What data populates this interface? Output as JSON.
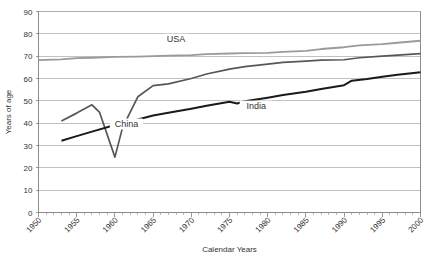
{
  "chart_data": {
    "type": "line",
    "title": "",
    "xlabel": "Calendar Years",
    "ylabel": "Years of age",
    "xlim": [
      1950,
      2000
    ],
    "ylim": [
      0,
      90
    ],
    "ytick_step": 10,
    "xtick_step": 5,
    "grid": true,
    "legend_position": "inline-annotations",
    "ytick_labels": [
      "0",
      "10",
      "20",
      "30",
      "40",
      "50",
      "60",
      "70",
      "80",
      "90"
    ],
    "ytick_values": [
      0,
      10,
      20,
      30,
      40,
      50,
      60,
      70,
      80,
      90
    ],
    "xtick_labels": [
      "1950",
      "1955",
      "1960",
      "1965",
      "1970",
      "1975",
      "1980",
      "1985",
      "1990",
      "1995",
      "2000"
    ],
    "xtick_values": [
      1950,
      1955,
      1960,
      1965,
      1970,
      1975,
      1980,
      1985,
      1990,
      1995,
      2000
    ],
    "series": [
      {
        "name": "USA",
        "color": "#9a9a9a",
        "width": 1.8,
        "label": "USA",
        "label_x": 1968.0,
        "label_y": 76.5,
        "x": [
          1950,
          1953,
          1955,
          1957,
          1960,
          1963,
          1965,
          1967,
          1970,
          1972,
          1975,
          1977,
          1980,
          1982,
          1985,
          1987,
          1990,
          1992,
          1995,
          1997,
          2000
        ],
        "values": [
          68.2,
          68.6,
          69.1,
          69.3,
          69.7,
          69.8,
          70.0,
          70.2,
          70.5,
          70.9,
          71.2,
          71.4,
          71.5,
          71.9,
          72.4,
          73.2,
          74.0,
          74.8,
          75.4,
          76.0,
          76.9
        ]
      },
      {
        "name": "China",
        "color": "#575757",
        "width": 1.7,
        "label": "China",
        "label_x": 1961.5,
        "label_y": 38.5,
        "x": [
          1953,
          1955,
          1957,
          1958,
          1960,
          1961,
          1963,
          1965,
          1967,
          1970,
          1972,
          1975,
          1977,
          1980,
          1982,
          1985,
          1987,
          1990,
          1992,
          1995,
          1997,
          2000
        ],
        "values": [
          41.0,
          44.5,
          48.2,
          44.8,
          24.8,
          38.0,
          51.8,
          56.8,
          57.6,
          60.0,
          62.0,
          64.2,
          65.3,
          66.4,
          67.2,
          67.8,
          68.2,
          68.4,
          69.3,
          70.0,
          70.5,
          71.1
        ]
      },
      {
        "name": "India",
        "color": "#1a1a1a",
        "width": 2.0,
        "label": "India",
        "label_x": 1978.5,
        "label_y": 46.5,
        "x": [
          1953,
          1955,
          1957,
          1960,
          1963,
          1965,
          1967,
          1970,
          1972,
          1975,
          1976,
          1977,
          1980,
          1982,
          1985,
          1987,
          1990,
          1991,
          1993,
          1995,
          1997,
          2000
        ],
        "values": [
          32.1,
          34.2,
          36.2,
          39.2,
          41.6,
          43.4,
          44.7,
          46.5,
          47.8,
          49.6,
          48.8,
          49.8,
          51.4,
          52.6,
          54.1,
          55.3,
          57.0,
          59.0,
          59.8,
          60.8,
          61.7,
          62.8
        ]
      }
    ]
  },
  "labels": {
    "xlabel": "Calendar Years",
    "ylabel": "Years of age"
  }
}
